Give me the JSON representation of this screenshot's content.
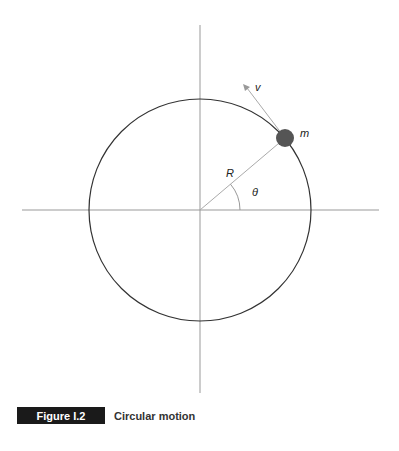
{
  "diagram": {
    "title": "Circular motion",
    "labels": {
      "velocity": "v",
      "mass": "m",
      "radius": "R",
      "angle": "θ"
    },
    "colors": {
      "axis": "#999999",
      "circle": "#333333",
      "mass": "#555555",
      "vector": "#999999"
    }
  },
  "caption": {
    "figure_label": "Figure I.2",
    "title": "Circular motion"
  }
}
